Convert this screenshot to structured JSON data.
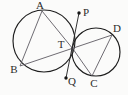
{
  "figure": {
    "background_color": "#fbfbfa",
    "width": 128,
    "height": 95,
    "colors": {
      "circle_stroke": "#1d1d1d",
      "chord_stroke": "#55525a",
      "tangent_stroke": "#2a2a2a",
      "label_fill": "#2b2b2b",
      "dot_fill": "#161616"
    }
  },
  "circles": [
    {
      "name": "left-circle",
      "cx": 44,
      "cy": 41,
      "r": 31
    },
    {
      "name": "right-circle",
      "cx": 96,
      "cy": 52,
      "r": 24
    }
  ],
  "points": [
    {
      "id": "A",
      "label": "A",
      "x": 42,
      "y": 11,
      "label_x": 40,
      "label_y": 6,
      "dot": false
    },
    {
      "id": "B",
      "label": "B",
      "x": 20,
      "y": 66,
      "label_x": 14,
      "label_y": 70,
      "dot": false
    },
    {
      "id": "T",
      "label": "T",
      "x": 73,
      "y": 49,
      "label_x": 61,
      "label_y": 45,
      "dot": false
    },
    {
      "id": "C",
      "label": "C",
      "x": 92,
      "y": 76,
      "label_x": 94,
      "label_y": 84,
      "dot": false
    },
    {
      "id": "D",
      "label": "D",
      "x": 112,
      "y": 35,
      "label_x": 117,
      "label_y": 29,
      "dot": false
    },
    {
      "id": "P",
      "label": "P",
      "x": 79,
      "y": 13,
      "label_x": 86,
      "label_y": 13,
      "dot": true
    },
    {
      "id": "Q",
      "label": "Q",
      "x": 66,
      "y": 78,
      "label_x": 72,
      "label_y": 82,
      "dot": true
    }
  ],
  "segments": [
    {
      "name": "chord-AB",
      "from": "A",
      "to": "B",
      "style": "chord"
    },
    {
      "name": "chord-AT",
      "from": "A",
      "to": "T",
      "style": "chord"
    },
    {
      "name": "secant-B-T-D",
      "from": "B",
      "to": "D",
      "style": "chord"
    },
    {
      "name": "chord-TC",
      "from": "T",
      "to": "C",
      "style": "chord"
    },
    {
      "name": "chord-CD",
      "from": "C",
      "to": "D",
      "style": "chord"
    },
    {
      "name": "tangent-PQ",
      "from": "P",
      "to": "Q",
      "style": "tangent"
    }
  ],
  "labels_order": [
    "A",
    "P",
    "D",
    "T",
    "B",
    "Q",
    "C"
  ]
}
